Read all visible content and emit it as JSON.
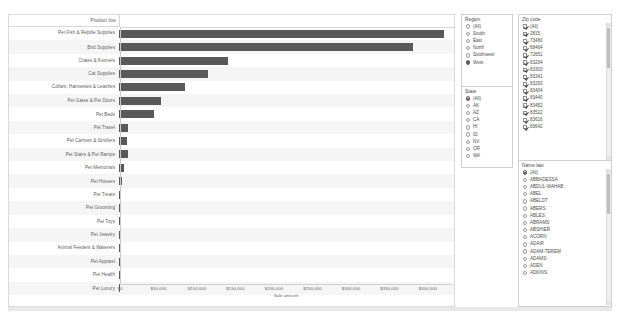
{
  "chart_data": {
    "type": "bar",
    "orientation": "horizontal",
    "title": "",
    "column_header": "Product line",
    "xlabel": "Sale amount",
    "ylabel": "Product line",
    "xlim": [
      0,
      430000
    ],
    "ticks": [
      "$0",
      "$50,000",
      "$100,000",
      "$150,000",
      "$200,000",
      "$250,000",
      "$300,000",
      "$350,000",
      "$400,000"
    ],
    "tick_values": [
      0,
      50000,
      100000,
      150000,
      200000,
      250000,
      300000,
      350000,
      400000
    ],
    "grid": false,
    "legend": "none",
    "bar_color": "#595959",
    "categories": [
      "Pet Fish & Reptile Supplies",
      "Bird Supplies",
      "Crates & Kennels",
      "Cat Supplies",
      "Collars, Harnesses & Leashes",
      "Pet Gates & Pet Doors",
      "Pet Beds",
      "Pet Travel",
      "Pet Carriers & Strollers",
      "Pet Stairs & Pet Ramps",
      "Pet Memorials",
      "Pet Houses",
      "Pet Treats",
      "Pet Grooming",
      "Pet Toys",
      "Pet Jewelry",
      "Animal Feeders & Waterers",
      "Pet Apparel",
      "Pet Health",
      "Pet Luxury"
    ],
    "values": [
      422000,
      382000,
      142000,
      116000,
      86000,
      55000,
      45000,
      12000,
      11000,
      12000,
      6000,
      4500,
      2500,
      1800,
      1600,
      2200,
      1500,
      1200,
      1000,
      1000
    ]
  },
  "filters": {
    "region": {
      "title": "Region",
      "type": "radio",
      "selected": "West",
      "options": [
        "(All)",
        "South",
        "East",
        "North",
        "Southwest",
        "West"
      ]
    },
    "state": {
      "title": "State",
      "type": "radio",
      "selected": "(All)",
      "options": [
        "(All)",
        "AK",
        "AZ",
        "CA",
        "HI",
        "ID",
        "NV",
        "OR",
        "WA"
      ]
    },
    "zip": {
      "title": "Zip code",
      "type": "checkbox",
      "options": [
        "(All)",
        "2815",
        "73480",
        "68464",
        "72651",
        "83204",
        "83303",
        "83341",
        "83293",
        "83404",
        "83440",
        "83452",
        "83522",
        "83616",
        "83642"
      ],
      "all_checked": true
    },
    "name_last": {
      "title": "Name last",
      "type": "radio",
      "selected": "(All)",
      "options": [
        "(All)",
        "ABBADESSA",
        "ABDUL-WAHAB",
        "ABEL",
        "ABELDT",
        "ABERS",
        "ABLES",
        "ABRAMS",
        "ABSHIER",
        "ACORN",
        "ADAIR",
        "ADAM-TEREM",
        "ADAMS",
        "ADEN",
        "ADKINS"
      ]
    }
  }
}
